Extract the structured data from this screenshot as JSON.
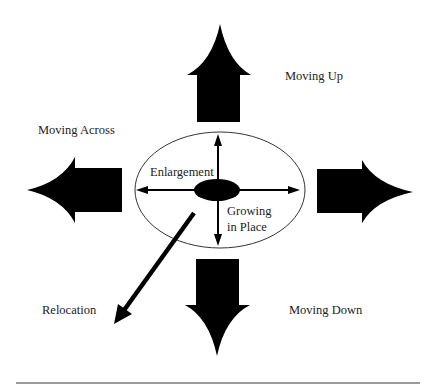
{
  "diagram": {
    "labels": {
      "moving_up": "Moving Up",
      "moving_across": "Moving Across",
      "moving_down": "Moving Down",
      "relocation": "Relocation",
      "enlargement": "Enlargement",
      "growing_line1": "Growing",
      "growing_line2": "in Place"
    },
    "colors": {
      "arrow_fill": "#000000",
      "ellipse_stroke": "#333333",
      "rule": "#9a9a9a",
      "text": "#222222"
    }
  }
}
